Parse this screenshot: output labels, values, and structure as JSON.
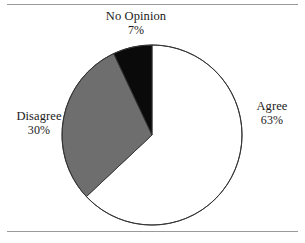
{
  "figure": {
    "background_color": "#ffffff",
    "frame_rule_color": "#9a9a9a",
    "has_top_rule": true,
    "has_bottom_rule": true
  },
  "chart_data": {
    "type": "pie",
    "title": "",
    "subtitle": "",
    "xlabel": "",
    "ylabel": "",
    "legend_position": "none",
    "grid": false,
    "start_angle_deg": 0,
    "direction": "clockwise",
    "center": {
      "x": 152,
      "y": 135
    },
    "radius": 90,
    "categories": [
      "Agree",
      "Disagree",
      "No Opinion"
    ],
    "values": [
      63,
      30,
      7
    ],
    "value_unit": "%",
    "slice_colors": [
      "#ffffff",
      "#6e6e6e",
      "#0a0a0a"
    ],
    "slice_edge_color": "#333333",
    "slices": [
      {
        "name": "Agree",
        "value": 63,
        "label": "Agree",
        "value_label": "63%",
        "color": "#ffffff",
        "start_deg": 0,
        "end_deg": 226.8
      },
      {
        "name": "Disagree",
        "value": 30,
        "label": "Disagree",
        "value_label": "30%",
        "color": "#6e6e6e",
        "start_deg": 226.8,
        "end_deg": 334.8
      },
      {
        "name": "No Opinion",
        "value": 7,
        "label": "No Opinion",
        "value_label": "7%",
        "color": "#0a0a0a",
        "start_deg": 334.8,
        "end_deg": 360
      }
    ]
  },
  "labels": {
    "no_opinion": {
      "name": "No Opinion",
      "value": "7%"
    },
    "agree": {
      "name": "Agree",
      "value": "63%"
    },
    "disagree": {
      "name": "Disagree",
      "value": "30%"
    }
  }
}
